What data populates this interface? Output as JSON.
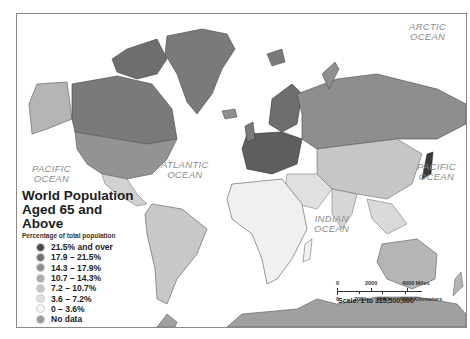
{
  "map": {
    "title_line1": "World Population",
    "title_line2": "Aged 65 and Above",
    "subtitle": "Percentage of total population",
    "legend": [
      {
        "label": "21.5% and over",
        "color": "#4a4a4a"
      },
      {
        "label": "17.9 – 21.5%",
        "color": "#6e6e6e"
      },
      {
        "label": "14.3 – 17.9%",
        "color": "#8e8e8e"
      },
      {
        "label": "10.7 – 14.3%",
        "color": "#ababab"
      },
      {
        "label": "7.2 – 10.7%",
        "color": "#c6c6c6"
      },
      {
        "label": "3.6 – 7.2%",
        "color": "#e0e0e0"
      },
      {
        "label": "0 – 3.6%",
        "color": "#f6f6f6"
      },
      {
        "label": "No data",
        "color": "#9a9a9a"
      }
    ],
    "oceans": {
      "arctic": [
        "ARCTIC",
        "OCEAN"
      ],
      "pacific_west": [
        "PACIFIC",
        "OCEAN"
      ],
      "pacific_east": [
        "PACIFIC",
        "OCEAN"
      ],
      "atlantic": [
        "ATLANTIC",
        "OCEAN"
      ],
      "indian": [
        "INDIAN",
        "OCEAN"
      ]
    },
    "scale": {
      "miles_ticks": [
        "0",
        "2000",
        "4000 Miles"
      ],
      "km_ticks": [
        "0",
        "2000",
        "4000",
        "6000 Kilometers"
      ],
      "ratio_label": "Scale: 1 to 315,500,000"
    }
  }
}
